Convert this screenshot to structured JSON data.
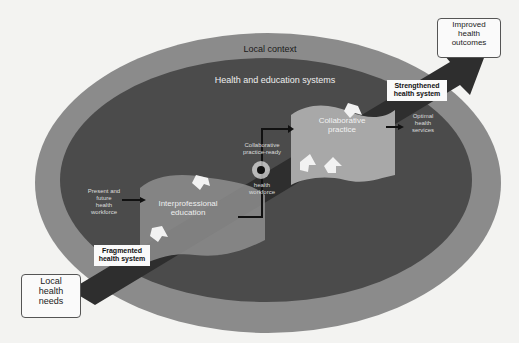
{
  "diagram": {
    "outer_label": "Local context",
    "inner_label": "Health and education systems",
    "colors": {
      "background": "#f3f3f1",
      "outer_ring": "#8b8b8b",
      "inner_area": "#4d4d4d",
      "flow_shape": "#9a9a9a",
      "collab_shape": "#a9a9a9",
      "arrow_dark": "#2b2b2b"
    },
    "nodes": {
      "local_needs": "Local health needs",
      "local_needs_lines": [
        "Local",
        "health",
        "needs"
      ],
      "fragmented": [
        "Fragmented",
        "health system"
      ],
      "present_future": [
        "Present and",
        "future",
        "health",
        "workforce"
      ],
      "ipe": [
        "Interprofessional",
        "education"
      ],
      "collab_ready_top": [
        "Collaborative",
        "practice-ready"
      ],
      "collab_ready_bottom": [
        "health",
        "workforce"
      ],
      "collab_practice": [
        "Collaborative",
        "practice"
      ],
      "optimal": [
        "Optimal",
        "health",
        "services"
      ],
      "strengthened": [
        "Strengthened",
        "health system"
      ],
      "improved": [
        "Improved",
        "health",
        "outcomes"
      ]
    }
  }
}
